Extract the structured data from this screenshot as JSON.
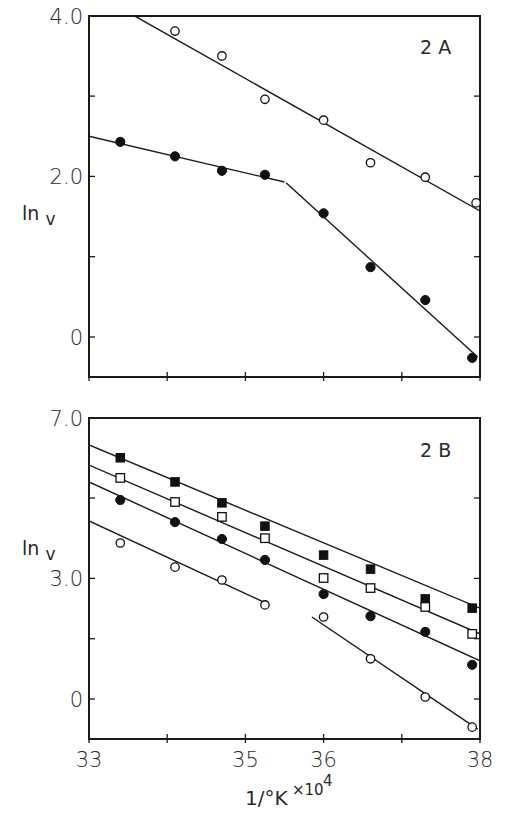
{
  "chart_data": [
    {
      "type": "scatter",
      "panel_label": "2 A",
      "title": "",
      "xlabel": "1/°K ×10⁴",
      "ylabel": "ln v",
      "xlim": [
        33,
        38
      ],
      "ylim": [
        -0.5,
        4.0
      ],
      "x_ticks": [
        33,
        34,
        35,
        36,
        37,
        38
      ],
      "y_ticks": [
        0,
        1.0,
        2.0,
        3.0,
        4.0
      ],
      "y_tick_labels": [
        {
          "value": 4.0,
          "label": "4.0"
        },
        {
          "value": 2.0,
          "label": "2.0"
        },
        {
          "value": 0,
          "label": "0"
        }
      ],
      "grid": false,
      "legend": null,
      "series": [
        {
          "name": "open circles",
          "marker": "circle-open",
          "x": [
            34.1,
            34.7,
            35.25,
            36.0,
            36.6,
            37.3,
            37.95
          ],
          "y": [
            3.81,
            3.5,
            2.96,
            2.7,
            2.17,
            1.99,
            1.67
          ],
          "fit_lines": [
            {
              "x": [
                33.58,
                38.0
              ],
              "y": [
                4.0,
                1.57
              ]
            }
          ]
        },
        {
          "name": "filled circles",
          "marker": "circle-filled",
          "x": [
            33.4,
            34.1,
            34.7,
            35.25,
            36.0,
            36.6,
            37.3,
            37.9
          ],
          "y": [
            2.43,
            2.25,
            2.07,
            2.02,
            1.54,
            0.87,
            0.46,
            -0.26
          ],
          "fit_lines": [
            {
              "x": [
                33.0,
                35.5
              ],
              "y": [
                2.5,
                1.93
              ]
            },
            {
              "x": [
                35.52,
                37.97
              ],
              "y": [
                1.92,
                -0.25
              ]
            }
          ]
        }
      ]
    },
    {
      "type": "scatter",
      "panel_label": "2 B",
      "title": "",
      "xlabel": "1/°K ×10⁴",
      "ylabel": "ln v",
      "xlim": [
        33,
        38
      ],
      "ylim": [
        -1.0,
        7.0
      ],
      "x_ticks": [
        33,
        34,
        35,
        36,
        37,
        38
      ],
      "x_tick_labels": [
        {
          "value": 33,
          "label": "33"
        },
        {
          "value": 35,
          "label": "35"
        },
        {
          "value": 36,
          "label": "36"
        },
        {
          "value": 38,
          "label": "38"
        }
      ],
      "y_ticks": [
        0,
        1.5,
        3.0,
        5.0,
        7.0
      ],
      "y_tick_labels": [
        {
          "value": 7.0,
          "label": "7.0"
        },
        {
          "value": 3.0,
          "label": "3.0"
        },
        {
          "value": 0,
          "label": "0"
        }
      ],
      "grid": false,
      "legend": null,
      "series": [
        {
          "name": "filled squares",
          "marker": "square-filled",
          "x": [
            33.4,
            34.1,
            34.7,
            35.25,
            36.0,
            36.6,
            37.3,
            37.9
          ],
          "y": [
            6.0,
            5.4,
            4.88,
            4.3,
            3.58,
            3.23,
            2.49,
            2.26
          ],
          "fit_lines": [
            {
              "x": [
                33.0,
                38.0
              ],
              "y": [
                6.32,
                2.26
              ]
            }
          ]
        },
        {
          "name": "open squares",
          "marker": "square-open",
          "x": [
            33.4,
            34.1,
            34.7,
            35.25,
            36.0,
            36.6,
            37.3,
            37.9
          ],
          "y": [
            5.5,
            4.9,
            4.53,
            4.0,
            3.01,
            2.76,
            2.29,
            1.62
          ],
          "fit_lines": [
            {
              "x": [
                33.0,
                38.0
              ],
              "y": [
                5.82,
                1.62
              ]
            }
          ]
        },
        {
          "name": "filled circles",
          "marker": "circle-filled",
          "x": [
            33.4,
            34.1,
            34.7,
            35.25,
            36.0,
            36.6,
            37.3,
            37.9
          ],
          "y": [
            4.95,
            4.4,
            3.98,
            3.46,
            2.61,
            2.06,
            1.67,
            0.85
          ],
          "fit_lines": [
            {
              "x": [
                33.0,
                38.0
              ],
              "y": [
                5.4,
                0.95
              ]
            }
          ]
        },
        {
          "name": "open circles",
          "marker": "circle-open",
          "x": [
            33.4,
            34.1,
            34.7,
            35.25,
            36.0,
            36.6,
            37.3,
            37.9
          ],
          "y": [
            3.88,
            3.28,
            2.96,
            2.34,
            2.04,
            1.0,
            0.05,
            -0.7
          ],
          "fit_lines": [
            {
              "x": [
                33.0,
                35.29
              ],
              "y": [
                4.43,
                2.36
              ]
            },
            {
              "x": [
                35.85,
                37.97
              ],
              "y": [
                2.04,
                -0.75
              ]
            }
          ]
        }
      ]
    }
  ],
  "figure": {
    "panels": [
      {
        "label": "2 A",
        "ylabel_main": "ln",
        "ylabel_sub": "v"
      },
      {
        "label": "2 B",
        "ylabel_main": "ln",
        "ylabel_sub": "v"
      }
    ],
    "xlabel_main": "1/°K",
    "xlabel_mult": "×10",
    "xlabel_exp": "4"
  }
}
